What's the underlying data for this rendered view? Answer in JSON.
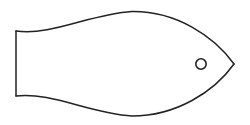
{
  "document": {
    "title": "Fish Line Drawing",
    "kind": "line-art-illustration",
    "subject": "fish",
    "style": "outline, monochrome, no fill"
  },
  "canvas": {
    "width": 250,
    "height": 125,
    "background_color": "#ffffff"
  },
  "style": {
    "stroke_color": "#222222",
    "stroke_width": 1.5,
    "fill": "none"
  },
  "illustration": {
    "name": "fish",
    "description": "Simple outline fish made of two crossing arcs forming the body, a straight vertical line closing the tail fin, and a small circle for the eye.",
    "parts": [
      {
        "name": "body-upper-arc",
        "type": "curve",
        "description": "Upper body arc sweeping from the tail crossing up over the back to the snout tip",
        "start": [
          16,
          31
        ],
        "end": [
          234,
          64
        ],
        "peak": [
          132,
          11
        ]
      },
      {
        "name": "body-lower-arc",
        "type": "curve",
        "description": "Lower body arc sweeping from the tail crossing down under the belly to the snout tip",
        "start": [
          16,
          96
        ],
        "end": [
          234,
          64
        ],
        "trough": [
          132,
          116
        ]
      },
      {
        "name": "tail-fin-edge",
        "type": "line",
        "description": "Vertical straight line closing the back of the tail fin",
        "start": [
          16,
          31
        ],
        "end": [
          16,
          96
        ]
      },
      {
        "name": "tail-crossing-point",
        "type": "point",
        "description": "Point where the two body arcs intersect to form the tail notch",
        "position": [
          37,
          64
        ]
      },
      {
        "name": "snout-tip",
        "type": "point",
        "description": "Pointed mouth where the two arcs meet at the right",
        "position": [
          234,
          64
        ]
      },
      {
        "name": "eye",
        "type": "circle",
        "center": [
          201,
          64
        ],
        "radius": 5.2
      }
    ]
  },
  "geometry": {
    "upper_arc_path": "M 16 31 C 52 36 90 14 132 11.5 C 176 11 214 36 234 64",
    "lower_arc_path": "M 16 96 C 52 92 90 113.5 132 116 C 176 116 214 92 234 64",
    "tail_line_path": "M 16 31 L 16 96",
    "eye_center_x": 201,
    "eye_center_y": 64,
    "eye_radius": 5.2
  }
}
